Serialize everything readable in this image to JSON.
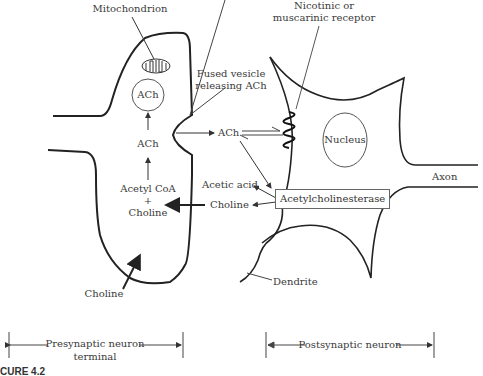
{
  "diagram": {
    "labels": {
      "mitochondrion": "Mitochondrion",
      "ach_vesicle": "ACh",
      "ach_presynaptic": "ACh",
      "acetyl_coa": "Acetyl CoA",
      "plus": "+",
      "choline_inside": "Choline",
      "choline_uptake": "Choline",
      "fused_vesicle_line1": "Fused vesicle",
      "fused_vesicle_line2": "releasing ACh",
      "ach_cleft": "ACh",
      "receptor_line1": "Nicotinic or",
      "receptor_line2": "muscarinic receptor",
      "nucleus": "Nucleus",
      "axon": "Axon",
      "acetic_acid": "Acetic acid",
      "choline_cleft": "Choline",
      "enzyme": "Acetylcholinesterase",
      "dendrite": "Dendrite"
    },
    "spans": {
      "presynaptic_line1": "Presynaptic neuron",
      "presynaptic_line2": "terminal",
      "postsynaptic": "Postsynaptic neuron"
    },
    "caption": "CURE 4.2"
  }
}
